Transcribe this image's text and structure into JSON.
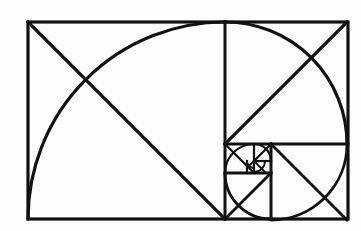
{
  "figure": {
    "title": "Golden Ratio Fibonacci Spiral Construction",
    "caption": "",
    "background_color": "#fdfdfb",
    "stroke_color": "#111111",
    "outer_rect": {
      "x": 28,
      "y": 22,
      "width": 320,
      "height": 197,
      "stroke_width": 3.2
    },
    "squares": [
      {
        "index": 1,
        "name": "square-1-large-left",
        "x": 28,
        "y": 22,
        "size": 197,
        "arc_center_corner": "top-right",
        "arc_from": "top-right",
        "arc_to": "bottom-left",
        "diagonal_from": "top-left",
        "diagonal_to": "bottom-right"
      },
      {
        "index": 2,
        "name": "square-2-top-right",
        "x": 225,
        "y": 22,
        "size": 122,
        "arc_center_corner": "bottom-left",
        "arc_from": "top-left",
        "arc_to": "bottom-right",
        "diagonal_from": "top-right",
        "diagonal_to": "bottom-left"
      },
      {
        "index": 3,
        "name": "square-3-bottom-right",
        "x": 271,
        "y": 144,
        "size": 76,
        "arc_center_corner": "top-left",
        "arc_from": "top-right",
        "arc_to": "bottom-left",
        "diagonal_from": "bottom-right",
        "diagonal_to": "top-left"
      },
      {
        "index": 4,
        "name": "square-4-bottom-left-inner",
        "x": 225,
        "y": 173,
        "size": 46,
        "arc_center_corner": "top-right",
        "arc_from": "bottom-right",
        "arc_to": "top-left",
        "diagonal_from": "bottom-left",
        "diagonal_to": "top-right"
      },
      {
        "index": 5,
        "name": "square-5-mid-inner",
        "x": 225,
        "y": 144,
        "size": 29,
        "arc_center_corner": "bottom-right",
        "arc_from": "bottom-left",
        "arc_to": "top-right",
        "diagonal_from": "top-left",
        "diagonal_to": "bottom-right"
      },
      {
        "index": 6,
        "name": "square-6-small-inner",
        "x": 254,
        "y": 144,
        "size": 17,
        "arc_center_corner": "bottom-left",
        "arc_from": "top-left",
        "arc_to": "bottom-right",
        "diagonal_from": "top-right",
        "diagonal_to": "bottom-left"
      },
      {
        "index": 7,
        "name": "square-7-tiny-inner",
        "x": 254,
        "y": 161,
        "size": 11,
        "arc_center_corner": "top-left",
        "arc_from": "top-right",
        "arc_to": "bottom-left",
        "diagonal_from": "bottom-right",
        "diagonal_to": "top-left"
      },
      {
        "index": 8,
        "name": "square-8-micro-inner",
        "x": 247,
        "y": 161,
        "size": 7,
        "arc_center_corner": "top-right",
        "arc_from": "bottom-right",
        "arc_to": "top-left",
        "diagonal_from": "bottom-left",
        "diagonal_to": "top-right"
      }
    ],
    "divider_lines": [
      {
        "name": "divider-vertical-main",
        "x1": 225,
        "y1": 22,
        "x2": 225,
        "y2": 219
      },
      {
        "name": "divider-horizontal-right",
        "x1": 225,
        "y1": 144,
        "x2": 348,
        "y2": 144
      },
      {
        "name": "divider-vertical-sub",
        "x1": 271,
        "y1": 144,
        "x2": 271,
        "y2": 219
      },
      {
        "name": "divider-horizontal-sub",
        "x1": 225,
        "y1": 173,
        "x2": 271,
        "y2": 173
      },
      {
        "name": "divider-vertical-micro",
        "x1": 254,
        "y1": 144,
        "x2": 254,
        "y2": 173
      },
      {
        "name": "divider-horizontal-micro",
        "x1": 254,
        "y1": 161,
        "x2": 271,
        "y2": 161
      },
      {
        "name": "divider-vertical-nano",
        "x1": 247,
        "y1": 161,
        "x2": 247,
        "y2": 173
      }
    ],
    "chart_data": {
      "type": "diagram",
      "title": "Golden Ratio Fibonacci Spiral Construction",
      "description": "Nested squares in golden-ratio proportion with inscribed quarter-circle arcs forming a logarithmic spiral, plus corner-to-corner diagonals.",
      "fibonacci_sequence": [
        1,
        1,
        2,
        3,
        5,
        8,
        13,
        21
      ],
      "square_sizes_px": [
        197,
        122,
        76,
        46,
        29,
        17,
        11,
        7
      ],
      "golden_ratio": 1.618,
      "aspect_ratio": "320 : 197",
      "square_count": 8,
      "arc_count": 8,
      "diagonal_count": 8,
      "xlabel": "",
      "ylabel": "",
      "grid": false,
      "legend": "none"
    }
  }
}
